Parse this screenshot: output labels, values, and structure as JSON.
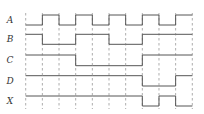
{
  "diagram": {
    "type": "timing-diagram",
    "colors": {
      "wave": "#555555",
      "grid": "#8a8a8a",
      "label": "#333333",
      "background": "#ffffff"
    },
    "time_slots": 10,
    "signals": [
      {
        "name": "A",
        "levels": [
          0,
          1,
          0,
          1,
          0,
          1,
          0,
          1,
          0,
          1
        ]
      },
      {
        "name": "B",
        "levels": [
          1,
          0,
          0,
          1,
          1,
          0,
          0,
          1,
          1,
          1
        ]
      },
      {
        "name": "C",
        "levels": [
          1,
          1,
          1,
          0,
          0,
          0,
          0,
          1,
          1,
          1
        ]
      },
      {
        "name": "D",
        "levels": [
          1,
          1,
          1,
          1,
          1,
          1,
          1,
          0,
          0,
          1
        ]
      },
      {
        "name": "X",
        "levels": [
          1,
          1,
          1,
          1,
          1,
          1,
          1,
          0,
          1,
          0
        ]
      }
    ]
  },
  "layout": {
    "x0": 25.7,
    "slot_width": 16.66,
    "rows": [
      {
        "high": 15,
        "low": 25,
        "label_y": 23
      },
      {
        "high": 34.3,
        "low": 44.3,
        "label_y": 42
      },
      {
        "high": 55,
        "low": 65.7,
        "label_y": 63
      },
      {
        "high": 75.7,
        "low": 86,
        "label_y": 84
      },
      {
        "high": 96,
        "low": 106,
        "label_y": 104
      }
    ],
    "label_x": 10,
    "grid_top": 13,
    "grid_bottom": 109
  }
}
